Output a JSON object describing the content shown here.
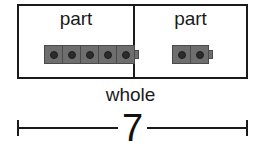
{
  "diagram": {
    "type": "part-part-whole",
    "parts": [
      {
        "label": "part",
        "cube_count": 5
      },
      {
        "label": "part",
        "cube_count": 2
      }
    ],
    "whole": {
      "label": "whole",
      "value": "7"
    }
  },
  "colors": {
    "border": "#1a1a1a",
    "cube_fill": "#6e6e6e",
    "cube_dot": "#2b2b2b"
  }
}
